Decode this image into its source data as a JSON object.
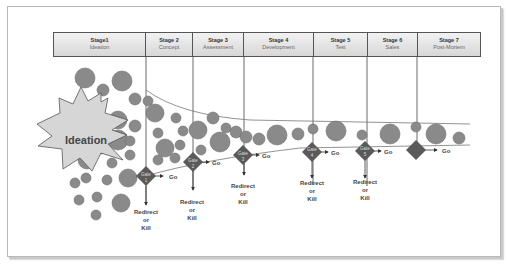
{
  "stages": [
    {
      "num": "Stage1",
      "name": "Ideation",
      "width": 92
    },
    {
      "num": "Stage 2",
      "name": "Concept",
      "width": 47
    },
    {
      "num": "Stage 3",
      "name": "Assessment",
      "width": 51
    },
    {
      "num": "Stage 4",
      "name": "Development",
      "width": 70
    },
    {
      "num": "Stage 5",
      "name": "Test",
      "width": 54
    },
    {
      "num": "Stage 6",
      "name": "Sales",
      "width": 50
    },
    {
      "num": "Stage 7",
      "name": "Post-Mortem",
      "width": 62
    }
  ],
  "ideation_label": "Ideation",
  "gates": [
    {
      "label": "Gate",
      "num": "1",
      "go": "Go",
      "redirect": [
        "Redirect",
        "or",
        "Kill"
      ]
    },
    {
      "label": "Gate",
      "num": "2",
      "go": "Go",
      "redirect": [
        "Redirect",
        "or",
        "Kill"
      ]
    },
    {
      "label": "Gate",
      "num": "3",
      "go": "Go",
      "redirect": [
        "Redirect",
        "or",
        "Kill"
      ]
    },
    {
      "label": "Gate",
      "num": "4",
      "go": "Go",
      "redirect": [
        "Redirect",
        "or",
        "Kill"
      ]
    },
    {
      "label": "Gate",
      "num": "5",
      "go": "Go",
      "redirect": [
        "Redirect",
        "or",
        "Kill"
      ]
    },
    {
      "label": "",
      "num": "",
      "go": "Go",
      "redirect": []
    }
  ],
  "colors": {
    "circle": "#8a8a8a",
    "circle_stroke": "#6e6e6e",
    "gate": "#5a5a5a",
    "burst": "#d9d9d9",
    "line": "#555555"
  }
}
